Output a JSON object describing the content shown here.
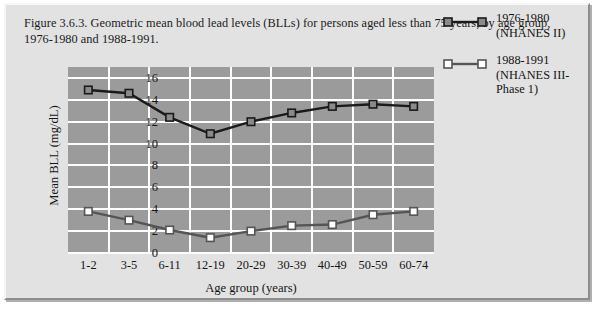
{
  "figure": {
    "caption": "Figure 3.6.3. Geometric mean blood lead levels (BLLs) for persons aged less than 75 years, by age group, 1976-1980 and 1988-1991."
  },
  "colors": {
    "plot_background": "#9b9b9b",
    "panel_background": "#e2e2e2",
    "gridline": "#fdfdfd",
    "series_1976_line": "#1a1a1a",
    "series_1976_marker_fill": "#8a8a8a",
    "series_1988_line": "#555555",
    "series_1988_marker_fill": "#ffffff"
  },
  "legend": {
    "position": "right",
    "entries": [
      {
        "name": "series-1976-1980",
        "label": "1976-1980 (NHANES II)",
        "lines": [
          "1976-1980",
          "(NHANES II)"
        ]
      },
      {
        "name": "series-1988-1991",
        "label": "1988-1991 (NHANES III-Phase 1)",
        "lines": [
          "1988-1991",
          "(NHANES III-",
          "Phase 1)"
        ]
      }
    ]
  },
  "chart_data": {
    "type": "line",
    "title": "Figure 3.6.3. Geometric mean blood lead levels (BLLs) for persons aged less than 75 years, by age group, 1976-1980 and 1988-1991.",
    "xlabel": "Age group (years)",
    "ylabel": "Mean BLL (mg/dL)",
    "categories": [
      "1-2",
      "3-5",
      "6-11",
      "12-19",
      "20-29",
      "30-39",
      "40-49",
      "50-59",
      "60-74"
    ],
    "yticks": [
      0,
      2,
      4,
      6,
      8,
      10,
      12,
      14,
      16
    ],
    "ylim": [
      0,
      17
    ],
    "grid": true,
    "series": [
      {
        "name": "1976-1980 (NHANES II)",
        "values": [
          14.9,
          14.6,
          12.4,
          10.9,
          12.0,
          12.8,
          13.4,
          13.6,
          13.4
        ]
      },
      {
        "name": "1988-1991 (NHANES III-Phase 1)",
        "values": [
          3.8,
          3.0,
          2.1,
          1.4,
          2.0,
          2.5,
          2.6,
          3.5,
          3.8
        ]
      }
    ]
  }
}
